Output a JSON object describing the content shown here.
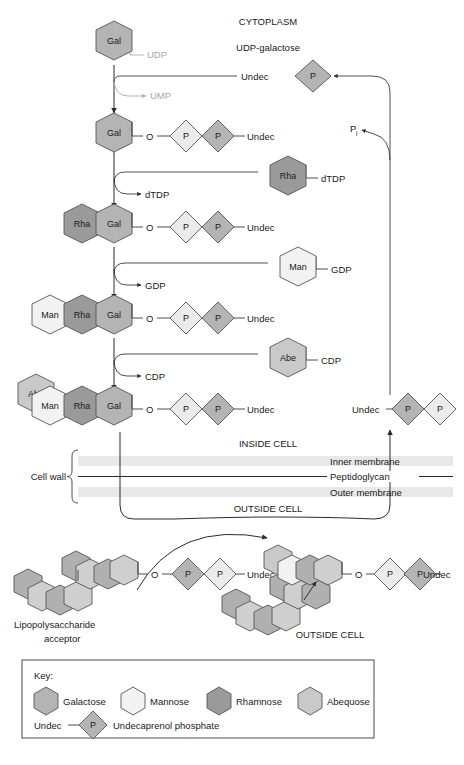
{
  "figure": {
    "compartments": {
      "cytoplasm": "CYTOPLASM",
      "inside_cell": "INSIDE CELL",
      "outside_cell": "OUTSIDE CELL",
      "outside_cell_2": "OUTSIDE CELL"
    },
    "cell_wall": {
      "bracket_label": "Cell wall",
      "layers": [
        "Inner membrane",
        "Peptidoglycan",
        "Outer membrane"
      ]
    }
  },
  "donors": {
    "udp_galactose": "UDP-galactose",
    "rha_donor_label": "dTDP",
    "man_donor_label": "GDP",
    "abe_donor_label": "CDP"
  },
  "byproducts": {
    "udp": "UDP",
    "ump": "UMP",
    "dtdp": "dTDP",
    "gdp": "GDP",
    "cdp": "CDP",
    "pi": "P",
    "pi_sub": "i"
  },
  "carrier": {
    "undec": "Undec",
    "p": "P",
    "o": "O"
  },
  "sugars": {
    "gal": "Gal",
    "rha": "Rha",
    "man": "Man",
    "abe": "Abe"
  },
  "acceptor": {
    "line1": "Lipopolysaccharide",
    "line2": "acceptor"
  },
  "key": {
    "heading": "Key:",
    "entries": [
      {
        "label": "Galactose",
        "color": "#b4b4b4"
      },
      {
        "label": "Mannose",
        "color": "#f2f2f2"
      },
      {
        "label": "Rhamnose",
        "color": "#9a9a9a"
      },
      {
        "label": "Abequose",
        "color": "#c9c9c9"
      }
    ],
    "carrier_entry": {
      "undec": "Undec",
      "p": "P",
      "label": "Undecaprenol phosphate"
    }
  },
  "colors": {
    "gal": "#b4b4b4",
    "man": "#f2f2f2",
    "rha": "#9a9a9a",
    "abe": "#c9c9c9",
    "p_dark": "#b4b4b4",
    "p_light": "#ebebeb",
    "lps_dark": "#b0b0b0",
    "lps_light": "#cfcfcf",
    "membrane": "#e8e8e8",
    "stroke": "#2b2b2b",
    "faded_text": "#a8a8a8"
  }
}
